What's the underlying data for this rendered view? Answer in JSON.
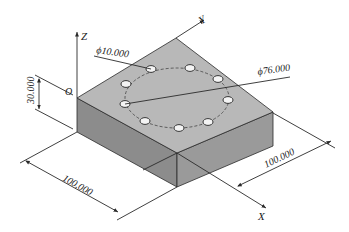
{
  "diagram": {
    "type": "isometric-part-drawing",
    "axes": {
      "x": "X",
      "y": "Y",
      "z": "Z",
      "origin": "O"
    },
    "dimensions": {
      "hole_diameter": "ϕ10.000",
      "bolt_circle_diameter": "ϕ76.000",
      "height": "30.000",
      "length_x": "100.000",
      "length_y": "100.000"
    },
    "colors": {
      "top_face": "#b8b8b8",
      "left_face": "#8c8c8c",
      "right_face": "#9a9a9a",
      "hole_fill": "#f4f4f4",
      "line": "#2a2a2a"
    },
    "holes": [
      {
        "x": 151,
        "y": 69
      },
      {
        "x": 190,
        "y": 68
      },
      {
        "x": 218,
        "y": 79
      },
      {
        "x": 228,
        "y": 100
      },
      {
        "x": 208,
        "y": 122
      },
      {
        "x": 179,
        "y": 128
      },
      {
        "x": 145,
        "y": 121
      },
      {
        "x": 125,
        "y": 104
      },
      {
        "x": 126,
        "y": 84
      }
    ]
  }
}
